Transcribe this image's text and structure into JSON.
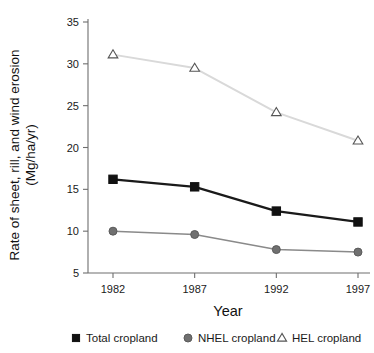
{
  "chart_data": {
    "type": "line",
    "title": "",
    "xlabel": "Year",
    "ylabel_line1": "Rate of sheet, rill, and wind erosion",
    "ylabel_line2": "(Mg/ha/yr)",
    "categories": [
      "1982",
      "1987",
      "1992",
      "1997"
    ],
    "x": [
      1982,
      1987,
      1992,
      1997
    ],
    "xlim": [
      1980.5,
      1998.5
    ],
    "ylim": [
      5,
      35
    ],
    "yticks": [
      5,
      10,
      15,
      20,
      25,
      30,
      35
    ],
    "ytick_labels": [
      "5",
      "10",
      "15",
      "20",
      "25",
      "30",
      "35"
    ],
    "xticks": [
      1982,
      1987,
      1992,
      1997
    ],
    "xtick_labels": [
      "1982",
      "1987",
      "1992",
      "1997"
    ],
    "grid": false,
    "legend_position": "bottom",
    "series": [
      {
        "name": "Total cropland",
        "marker": "square",
        "marker_color": "#111111",
        "line_color": "#1a1a1a",
        "values": [
          16.2,
          15.3,
          12.4,
          11.1
        ]
      },
      {
        "name": "NHEL cropland",
        "marker": "circle",
        "marker_color": "#707070",
        "line_color": "#8a8a8a",
        "values": [
          10.0,
          9.6,
          7.8,
          7.5
        ]
      },
      {
        "name": "HEL cropland",
        "marker": "triangle",
        "marker_color": "#ffffff",
        "marker_edge_color": "#555555",
        "line_color": "#d9d9d9",
        "values": [
          31.1,
          29.5,
          24.2,
          20.8
        ]
      }
    ]
  },
  "legend": {
    "items": [
      {
        "label": "Total cropland"
      },
      {
        "label": "NHEL cropland"
      },
      {
        "label": "HEL cropland"
      }
    ]
  }
}
